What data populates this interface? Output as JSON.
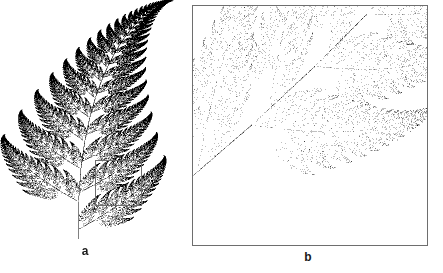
{
  "figure": {
    "caption_a": "a",
    "caption_b": "b",
    "background_color": "#ffffff",
    "ink_color": "#000000",
    "frame_color": "#6e6e6e"
  },
  "panel_a": {
    "label": "a",
    "description": "Barnsley fern (whole fractal)",
    "magnifier": {
      "name": "magnification-box",
      "x": 95,
      "y": 160,
      "width": 47,
      "height": 46,
      "border_color": "#6e6e6e"
    }
  },
  "panel_b": {
    "label": "b",
    "description": "Magnified detail of the boxed region of panel a",
    "frame": {
      "x": 192,
      "y": 5,
      "width": 236,
      "height": 241,
      "border_color": "#6e6e6e"
    }
  },
  "chart_data": {
    "type": "scatter",
    "xlabel": "",
    "ylabel": "",
    "grid": false,
    "legend": null,
    "point_color": "#000000",
    "point_count_a": 110000,
    "point_count_b": 320000,
    "xlim": [
      -2.182,
      2.6558
    ],
    "ylim": [
      0.0,
      9.9983
    ],
    "series": [
      {
        "name": "Barnsley fern IFS",
        "maps": [
          {
            "name": "stem",
            "probability": 0.01,
            "a": 0.0,
            "b": 0.0,
            "c": 0.0,
            "d": 0.16,
            "e": 0.0,
            "f": 0.0
          },
          {
            "name": "successively-smaller-leaflets",
            "probability": 0.85,
            "a": 0.85,
            "b": 0.04,
            "c": -0.04,
            "d": 0.85,
            "e": 0.0,
            "f": 1.6
          },
          {
            "name": "largest-left-leaflet",
            "probability": 0.07,
            "a": 0.2,
            "b": -0.26,
            "c": 0.23,
            "d": 0.22,
            "e": 0.0,
            "f": 1.6
          },
          {
            "name": "largest-right-leaflet",
            "probability": 0.07,
            "a": -0.15,
            "b": 0.28,
            "c": 0.26,
            "d": 0.24,
            "e": 0.0,
            "f": 0.44
          }
        ]
      }
    ],
    "panel_a_view": {
      "x_min": -2.2,
      "x_max": 2.7,
      "y_min": 0.0,
      "y_max": 10.0
    },
    "panel_b_view": {
      "x_min": 0.1,
      "x_max": 1.48,
      "y_min": 0.12,
      "y_max": 1.52
    }
  }
}
